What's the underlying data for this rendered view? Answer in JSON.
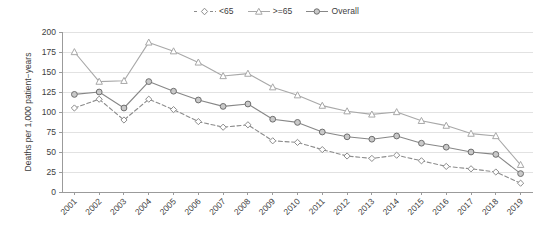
{
  "chart_data": {
    "type": "line",
    "title": "",
    "xlabel": "",
    "ylabel": "Deaths per 1,000 patient−years",
    "ylim": [
      0,
      200
    ],
    "yticks": [
      0,
      25,
      50,
      75,
      100,
      125,
      150,
      175,
      200
    ],
    "ytick_labels": [
      "0",
      "25",
      "50",
      "75",
      "100",
      "125",
      "150",
      "175",
      "200"
    ],
    "grid": true,
    "grid_axis": "y",
    "legend_position": "top-center",
    "categories": [
      "2001",
      "2002",
      "2003",
      "2004",
      "2005",
      "2006",
      "2007",
      "2008",
      "2009",
      "2010",
      "2011",
      "2012",
      "2013",
      "2014",
      "2015",
      "2016",
      "2017",
      "2018",
      "2019"
    ],
    "series": [
      {
        "name": "<65",
        "marker": "diamond",
        "linestyle": "dashed",
        "color": "#8c8c8c",
        "values": [
          105,
          116,
          90,
          116,
          103,
          88,
          81,
          84,
          64,
          62,
          53,
          45,
          42,
          46,
          39,
          32,
          29,
          25,
          11
        ]
      },
      {
        "name": ">=65",
        "marker": "triangle",
        "linestyle": "solid",
        "color": "#a8a8a8",
        "values": [
          175,
          138,
          139,
          187,
          176,
          162,
          145,
          148,
          131,
          121,
          108,
          101,
          97,
          100,
          89,
          83,
          73,
          70,
          34
        ]
      },
      {
        "name": "Overall",
        "marker": "circle",
        "linestyle": "solid",
        "color": "#878787",
        "values": [
          122,
          125,
          105,
          138,
          126,
          115,
          107,
          110,
          91,
          87,
          75,
          69,
          66,
          70,
          61,
          56,
          50,
          47,
          23
        ]
      }
    ]
  },
  "legend": {
    "items": [
      {
        "label": "<65"
      },
      {
        "label": ">=65"
      },
      {
        "label": "Overall"
      }
    ]
  },
  "colors": {
    "axis": "#9b9b9b",
    "grid": "#e2e2e2",
    "text": "#3d3d3d",
    "series_lt65": "#8c8c8c",
    "series_gte65": "#a8a8a8",
    "series_overall": "#878787",
    "background": "#ffffff"
  }
}
